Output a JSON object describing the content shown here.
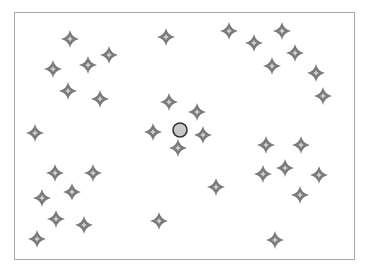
{
  "diagram": {
    "frame": {
      "x": 14,
      "y": 12,
      "width": 341,
      "height": 248,
      "border_color": "#a8a8a8"
    },
    "center_marker": {
      "icon": "circle-marker",
      "x": 180,
      "y": 130,
      "radius": 7,
      "fill": "#c8c8c8",
      "stroke": "#333333"
    },
    "star_style": {
      "icon": "four-point-star",
      "size": 18,
      "fill": "#7a7a7a",
      "highlight": "#d0d0d0"
    },
    "stars": [
      {
        "x": 70,
        "y": 39
      },
      {
        "x": 53,
        "y": 69
      },
      {
        "x": 88,
        "y": 65
      },
      {
        "x": 109,
        "y": 55
      },
      {
        "x": 68,
        "y": 91
      },
      {
        "x": 100,
        "y": 99
      },
      {
        "x": 166,
        "y": 37
      },
      {
        "x": 229,
        "y": 31
      },
      {
        "x": 254,
        "y": 43
      },
      {
        "x": 282,
        "y": 31
      },
      {
        "x": 295,
        "y": 53
      },
      {
        "x": 272,
        "y": 66
      },
      {
        "x": 316,
        "y": 73
      },
      {
        "x": 323,
        "y": 96
      },
      {
        "x": 35,
        "y": 133
      },
      {
        "x": 169,
        "y": 102
      },
      {
        "x": 197,
        "y": 112
      },
      {
        "x": 153,
        "y": 132
      },
      {
        "x": 203,
        "y": 135
      },
      {
        "x": 178,
        "y": 148
      },
      {
        "x": 266,
        "y": 145
      },
      {
        "x": 301,
        "y": 145
      },
      {
        "x": 263,
        "y": 174
      },
      {
        "x": 285,
        "y": 168
      },
      {
        "x": 319,
        "y": 175
      },
      {
        "x": 300,
        "y": 195
      },
      {
        "x": 216,
        "y": 187
      },
      {
        "x": 55,
        "y": 173
      },
      {
        "x": 93,
        "y": 173
      },
      {
        "x": 42,
        "y": 198
      },
      {
        "x": 72,
        "y": 192
      },
      {
        "x": 56,
        "y": 219
      },
      {
        "x": 84,
        "y": 225
      },
      {
        "x": 37,
        "y": 239
      },
      {
        "x": 159,
        "y": 221
      },
      {
        "x": 275,
        "y": 240
      }
    ]
  }
}
